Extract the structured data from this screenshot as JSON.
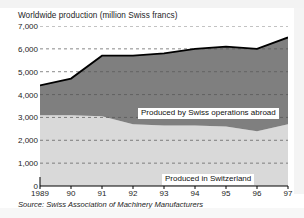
{
  "chart_data": {
    "type": "area",
    "title": "Worldwide production (million Swiss francs)",
    "subtitle": "",
    "xlabel": "",
    "ylabel": "",
    "stacked": true,
    "grid": true,
    "legend_position": "inline-on-bands",
    "source": "Source: Swiss Association of Machinery Manufacturers",
    "categories": [
      "1989",
      "90",
      "91",
      "92",
      "93",
      "94",
      "95",
      "96",
      "97"
    ],
    "x_tick_labels": [
      "1989",
      "90",
      "91",
      "92",
      "93",
      "94",
      "95",
      "96",
      "97"
    ],
    "y_tick_labels": [
      "0",
      "1,000",
      "2,000",
      "3,000",
      "4,000",
      "5,000",
      "6,000",
      "7,000"
    ],
    "y_ticks": [
      0,
      1000,
      2000,
      3000,
      4000,
      5000,
      6000,
      7000
    ],
    "ylim": [
      0,
      7000
    ],
    "series": [
      {
        "name": "Produced in Switzerland",
        "color": "#d9d9d9",
        "values": [
          3100,
          3100,
          3050,
          2700,
          2650,
          2650,
          2600,
          2400,
          2700
        ]
      },
      {
        "name": "Produced by Swiss operations abroad",
        "color": "#7f7f7f",
        "values": [
          1300,
          1600,
          2650,
          3000,
          3150,
          3350,
          3500,
          3600,
          3800
        ]
      }
    ],
    "totals": [
      4400,
      4700,
      5700,
      5700,
      5800,
      6000,
      6100,
      6000,
      6500
    ],
    "total_line_color": "#000000",
    "annotations": [
      {
        "text": "Produced by Swiss operations abroad",
        "series": "Produced by Swiss operations abroad"
      },
      {
        "text": "Produced in Switzerland",
        "series": "Produced in Switzerland"
      }
    ]
  },
  "labels": {
    "abroad": "Produced by Swiss operations abroad",
    "domestic": "Produced in Switzerland"
  }
}
